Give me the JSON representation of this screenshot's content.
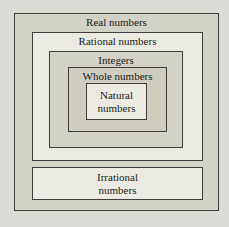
{
  "diagram": {
    "sets": {
      "real": {
        "label": "Real numbers"
      },
      "rational": {
        "label": "Rational numbers"
      },
      "integers": {
        "label": "Integers"
      },
      "whole": {
        "label": "Whole numbers"
      },
      "natural": {
        "line1": "Natural",
        "line2": "numbers"
      },
      "irrational": {
        "line1": "Irrational",
        "line2": "numbers"
      }
    },
    "colors": {
      "page_background": "#dcdbd5",
      "tan_fill": "#d3d2c6",
      "light_fill": "#ecebe3",
      "whole_fill": "#cecdbf",
      "border": "#3d3d3d",
      "text": "#1a1a1a"
    }
  }
}
